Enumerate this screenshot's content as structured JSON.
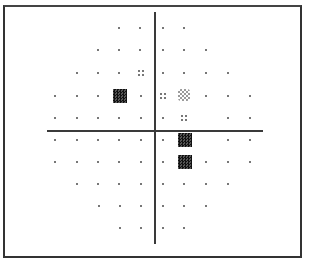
{
  "chart_data": {
    "type": "scatter",
    "title": "",
    "axes": {
      "vertical_x": 155,
      "horizontal_y": 131
    },
    "legend": {
      "dot": "normal",
      "quad": "mild defect",
      "gray": "moderate defect",
      "dark": "severe defect"
    },
    "points": [
      {
        "x": 119,
        "y": 28,
        "s": "dot"
      },
      {
        "x": 140,
        "y": 28,
        "s": "dot"
      },
      {
        "x": 163,
        "y": 28,
        "s": "dot"
      },
      {
        "x": 184,
        "y": 28,
        "s": "dot"
      },
      {
        "x": 98,
        "y": 50,
        "s": "dot"
      },
      {
        "x": 119,
        "y": 50,
        "s": "dot"
      },
      {
        "x": 140,
        "y": 50,
        "s": "dot"
      },
      {
        "x": 163,
        "y": 50,
        "s": "dot"
      },
      {
        "x": 184,
        "y": 50,
        "s": "dot"
      },
      {
        "x": 206,
        "y": 50,
        "s": "dot"
      },
      {
        "x": 77,
        "y": 73,
        "s": "dot"
      },
      {
        "x": 98,
        "y": 73,
        "s": "dot"
      },
      {
        "x": 119,
        "y": 73,
        "s": "dot"
      },
      {
        "x": 141,
        "y": 73,
        "s": "quad"
      },
      {
        "x": 163,
        "y": 73,
        "s": "dot"
      },
      {
        "x": 184,
        "y": 73,
        "s": "dot"
      },
      {
        "x": 206,
        "y": 73,
        "s": "dot"
      },
      {
        "x": 228,
        "y": 73,
        "s": "dot"
      },
      {
        "x": 55,
        "y": 96,
        "s": "dot"
      },
      {
        "x": 77,
        "y": 96,
        "s": "dot"
      },
      {
        "x": 98,
        "y": 96,
        "s": "dot"
      },
      {
        "x": 120,
        "y": 96,
        "s": "dark"
      },
      {
        "x": 141,
        "y": 96,
        "s": "dot"
      },
      {
        "x": 163,
        "y": 96,
        "s": "quad"
      },
      {
        "x": 184,
        "y": 95,
        "s": "gray"
      },
      {
        "x": 206,
        "y": 96,
        "s": "dot"
      },
      {
        "x": 228,
        "y": 96,
        "s": "dot"
      },
      {
        "x": 250,
        "y": 96,
        "s": "dot"
      },
      {
        "x": 55,
        "y": 118,
        "s": "dot"
      },
      {
        "x": 77,
        "y": 118,
        "s": "dot"
      },
      {
        "x": 98,
        "y": 118,
        "s": "dot"
      },
      {
        "x": 119,
        "y": 118,
        "s": "dot"
      },
      {
        "x": 141,
        "y": 118,
        "s": "dot"
      },
      {
        "x": 163,
        "y": 118,
        "s": "dot"
      },
      {
        "x": 184,
        "y": 118,
        "s": "quad"
      },
      {
        "x": 228,
        "y": 118,
        "s": "dot"
      },
      {
        "x": 250,
        "y": 118,
        "s": "dot"
      },
      {
        "x": 55,
        "y": 140,
        "s": "dot"
      },
      {
        "x": 77,
        "y": 140,
        "s": "dot"
      },
      {
        "x": 98,
        "y": 140,
        "s": "dot"
      },
      {
        "x": 119,
        "y": 140,
        "s": "dot"
      },
      {
        "x": 141,
        "y": 140,
        "s": "dot"
      },
      {
        "x": 163,
        "y": 140,
        "s": "dot"
      },
      {
        "x": 185,
        "y": 140,
        "s": "dark"
      },
      {
        "x": 228,
        "y": 140,
        "s": "dot"
      },
      {
        "x": 250,
        "y": 140,
        "s": "dot"
      },
      {
        "x": 55,
        "y": 162,
        "s": "dot"
      },
      {
        "x": 77,
        "y": 162,
        "s": "dot"
      },
      {
        "x": 98,
        "y": 162,
        "s": "dot"
      },
      {
        "x": 119,
        "y": 162,
        "s": "dot"
      },
      {
        "x": 141,
        "y": 162,
        "s": "dot"
      },
      {
        "x": 163,
        "y": 162,
        "s": "dot"
      },
      {
        "x": 185,
        "y": 162,
        "s": "dark"
      },
      {
        "x": 206,
        "y": 162,
        "s": "dot"
      },
      {
        "x": 228,
        "y": 162,
        "s": "dot"
      },
      {
        "x": 250,
        "y": 162,
        "s": "dot"
      },
      {
        "x": 77,
        "y": 184,
        "s": "dot"
      },
      {
        "x": 98,
        "y": 184,
        "s": "dot"
      },
      {
        "x": 119,
        "y": 184,
        "s": "dot"
      },
      {
        "x": 141,
        "y": 184,
        "s": "dot"
      },
      {
        "x": 163,
        "y": 184,
        "s": "dot"
      },
      {
        "x": 184,
        "y": 184,
        "s": "dot"
      },
      {
        "x": 206,
        "y": 184,
        "s": "dot"
      },
      {
        "x": 228,
        "y": 184,
        "s": "dot"
      },
      {
        "x": 99,
        "y": 206,
        "s": "dot"
      },
      {
        "x": 120,
        "y": 206,
        "s": "dot"
      },
      {
        "x": 141,
        "y": 206,
        "s": "dot"
      },
      {
        "x": 163,
        "y": 206,
        "s": "dot"
      },
      {
        "x": 184,
        "y": 206,
        "s": "dot"
      },
      {
        "x": 206,
        "y": 206,
        "s": "dot"
      },
      {
        "x": 120,
        "y": 228,
        "s": "dot"
      },
      {
        "x": 141,
        "y": 228,
        "s": "dot"
      },
      {
        "x": 163,
        "y": 228,
        "s": "dot"
      },
      {
        "x": 184,
        "y": 228,
        "s": "dot"
      }
    ]
  }
}
